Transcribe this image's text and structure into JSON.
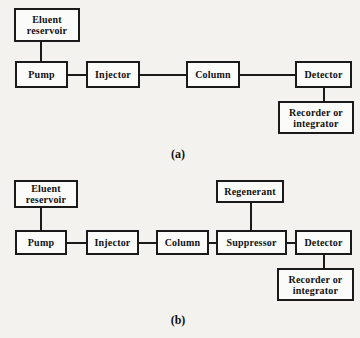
{
  "figure": {
    "background_color": "#f3f2ef",
    "line_color": "#1a1a1a",
    "box_fill_color": "#fbfbf9",
    "text_color": "#111111"
  },
  "panels": [
    {
      "id": "a",
      "caption": "(a)",
      "boxes": [
        {
          "id": "eluent-reservoir",
          "label": "Eluent\nreservoir"
        },
        {
          "id": "pump",
          "label": "Pump"
        },
        {
          "id": "injector",
          "label": "Injector"
        },
        {
          "id": "column",
          "label": "Column"
        },
        {
          "id": "detector",
          "label": "Detector"
        },
        {
          "id": "recorder-integrator",
          "label": "Recorder  or\nintegrator"
        }
      ]
    },
    {
      "id": "b",
      "caption": "(b)",
      "boxes": [
        {
          "id": "eluent-reservoir",
          "label": "Eluent\nreservoir"
        },
        {
          "id": "pump",
          "label": "Pump"
        },
        {
          "id": "injector",
          "label": "Injector"
        },
        {
          "id": "column",
          "label": "Column"
        },
        {
          "id": "regenerant",
          "label": "Regenerant"
        },
        {
          "id": "suppressor",
          "label": "Suppressor"
        },
        {
          "id": "detector",
          "label": "Detector"
        },
        {
          "id": "recorder-integrator",
          "label": "Recorder  or\nintegrator"
        }
      ]
    }
  ],
  "diagram_a": {
    "eluent_reservoir": "Eluent\nreservoir",
    "pump": "Pump",
    "injector": "Injector",
    "column": "Column",
    "detector": "Detector",
    "recorder": "Recorder  or\nintegrator",
    "caption": "(a)"
  },
  "diagram_b": {
    "eluent_reservoir": "Eluent\nreservoir",
    "pump": "Pump",
    "injector": "Injector",
    "column": "Column",
    "regenerant": "Regenerant",
    "suppressor": "Suppressor",
    "detector": "Detector",
    "recorder": "Recorder  or\nintegrator",
    "caption": "(b)"
  }
}
